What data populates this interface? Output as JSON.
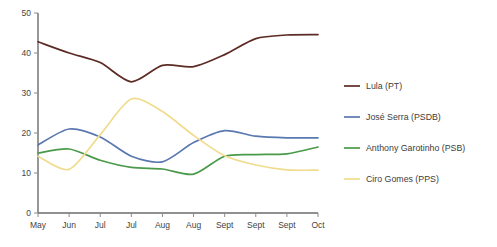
{
  "chart_data": {
    "type": "line",
    "title": "",
    "subtitle": "",
    "xlabel": "",
    "ylabel": "",
    "ylim": [
      0,
      50
    ],
    "yticks": [
      0,
      10,
      20,
      30,
      40,
      50
    ],
    "grid": false,
    "legend_position": "right",
    "categories": [
      "May",
      "Jun",
      "Jul",
      "Jul",
      "Aug",
      "Aug",
      "Sept",
      "Sept",
      "Sept",
      "Oct"
    ],
    "series": [
      {
        "name": "Lula (PT)",
        "color": "#5c2b24",
        "values": [
          42.8,
          40.0,
          37.6,
          32.8,
          36.9,
          36.6,
          39.6,
          43.6,
          44.5,
          44.6
        ]
      },
      {
        "name": "José Serra (PSDB)",
        "color": "#5a78b0",
        "values": [
          17.0,
          21.0,
          19.0,
          14.2,
          12.8,
          17.6,
          20.6,
          19.2,
          18.8,
          18.8
        ]
      },
      {
        "name": "Anthony Garotinho (PSB)",
        "color": "#4a9a4a",
        "values": [
          15.0,
          16.0,
          13.2,
          11.4,
          11.0,
          9.7,
          14.2,
          14.6,
          14.8,
          16.5
        ]
      },
      {
        "name": "Ciro Gomes (PPS)",
        "color": "#f0dc8c",
        "values": [
          14.2,
          10.9,
          19.6,
          28.5,
          25.4,
          19.4,
          14.3,
          12.0,
          10.8,
          10.7
        ]
      }
    ]
  },
  "legend": {
    "items": [
      {
        "label": "Lula (PT)",
        "color": "#5c2b24"
      },
      {
        "label": "José Serra (PSDB)",
        "color": "#5a78b0"
      },
      {
        "label": "Anthony Garotinho (PSB)",
        "color": "#4a9a4a"
      },
      {
        "label": "Ciro Gomes (PPS)",
        "color": "#f0dc8c"
      }
    ]
  }
}
